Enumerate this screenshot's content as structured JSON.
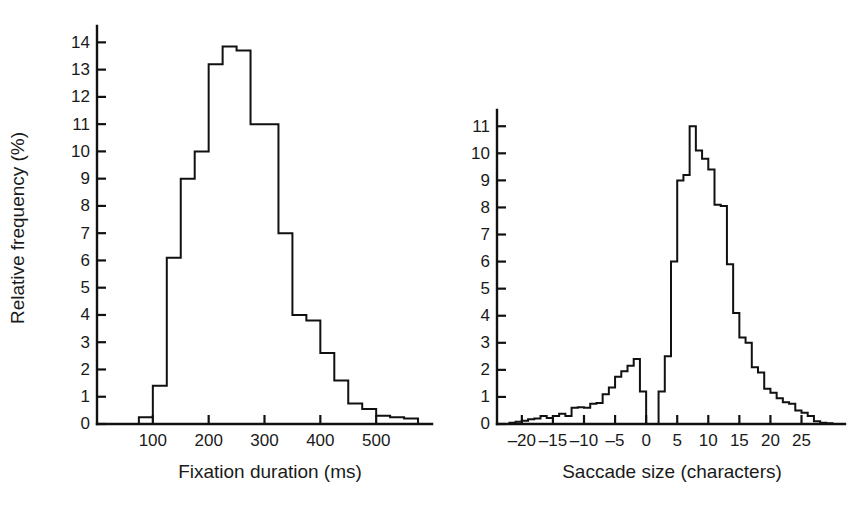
{
  "figure": {
    "shared_ylabel": "Relative frequency (%)",
    "background": "#ffffff",
    "line_color": "#111111"
  },
  "chart_data": [
    {
      "type": "bar",
      "id": "fixation-duration-histogram",
      "title": "",
      "xlabel": "Fixation duration (ms)",
      "ylabel": "Relative frequency (%)",
      "xlim": [
        0,
        600
      ],
      "ylim": [
        0,
        14.6
      ],
      "xticks": [
        100,
        200,
        300,
        400,
        500
      ],
      "xtick_labels": [
        "100",
        "200",
        "300",
        "400",
        "500"
      ],
      "yticks": [
        0,
        1,
        2,
        3,
        4,
        5,
        6,
        7,
        8,
        9,
        10,
        11,
        12,
        13,
        14
      ],
      "ytick_labels": [
        "0",
        "1",
        "2",
        "3",
        "4",
        "5",
        "6",
        "7",
        "8",
        "9",
        "10",
        "11",
        "12",
        "13",
        "14"
      ],
      "grid": false,
      "legend": "none",
      "bin_width": 25,
      "bin_edges": [
        0,
        25,
        50,
        75,
        100,
        125,
        150,
        175,
        200,
        225,
        250,
        275,
        300,
        325,
        350,
        375,
        400,
        425,
        450,
        475,
        500,
        525,
        550,
        575,
        600
      ],
      "categories": [
        "0-25",
        "25-50",
        "50-75",
        "75-100",
        "100-125",
        "125-150",
        "150-175",
        "175-200",
        "200-225",
        "225-250",
        "250-275",
        "275-300",
        "300-325",
        "325-350",
        "350-375",
        "375-400",
        "400-425",
        "425-450",
        "450-475",
        "475-500",
        "500-525",
        "525-550",
        "550-575",
        "575-600"
      ],
      "values": [
        0,
        0,
        0,
        0.25,
        1.4,
        6.1,
        9.0,
        10.0,
        13.2,
        13.85,
        13.7,
        11.0,
        11.0,
        7.0,
        4.0,
        3.8,
        2.6,
        1.6,
        0.75,
        0.55,
        0.3,
        0.25,
        0.2,
        0
      ]
    },
    {
      "type": "bar",
      "id": "saccade-size-histogram",
      "title": "",
      "xlabel": "Saccade size (characters)",
      "ylabel": "Relative frequency (%)",
      "xlim": [
        -24,
        32
      ],
      "ylim": [
        0,
        11.6
      ],
      "xticks": [
        -20,
        -15,
        -10,
        -5,
        0,
        5,
        10,
        15,
        20,
        25
      ],
      "xtick_labels": [
        "–20",
        "–15",
        "–10",
        "–5",
        "0",
        "5",
        "10",
        "15",
        "20",
        "25"
      ],
      "yticks": [
        0,
        1,
        2,
        3,
        4,
        5,
        6,
        7,
        8,
        9,
        10,
        11
      ],
      "ytick_labels": [
        "0",
        "1",
        "2",
        "3",
        "4",
        "5",
        "6",
        "7",
        "8",
        "9",
        "10",
        "11"
      ],
      "grid": false,
      "legend": "none",
      "bin_width": 1,
      "bin_edges": [
        -24,
        -23,
        -22,
        -21,
        -20,
        -19,
        -18,
        -17,
        -16,
        -15,
        -14,
        -13,
        -12,
        -11,
        -10,
        -9,
        -8,
        -7,
        -6,
        -5,
        -4,
        -3,
        -2,
        -1,
        0,
        1,
        2,
        3,
        4,
        5,
        6,
        7,
        8,
        9,
        10,
        11,
        12,
        13,
        14,
        15,
        16,
        17,
        18,
        19,
        20,
        21,
        22,
        23,
        24,
        25,
        26,
        27,
        28,
        29,
        30,
        31,
        32
      ],
      "categories": [
        "-24",
        "-23",
        "-22",
        "-21",
        "-20",
        "-19",
        "-18",
        "-17",
        "-16",
        "-15",
        "-14",
        "-13",
        "-12",
        "-11",
        "-10",
        "-9",
        "-8",
        "-7",
        "-6",
        "-5",
        "-4",
        "-3",
        "-2",
        "-1",
        "0",
        "1",
        "2",
        "3",
        "4",
        "5",
        "6",
        "7",
        "8",
        "9",
        "10",
        "11",
        "12",
        "13",
        "14",
        "15",
        "16",
        "17",
        "18",
        "19",
        "20",
        "21",
        "22",
        "23",
        "24",
        "25",
        "26",
        "27",
        "28",
        "29",
        "30",
        "31"
      ],
      "values": [
        0,
        0,
        0.05,
        0.08,
        0.12,
        0.18,
        0.2,
        0.3,
        0.22,
        0.3,
        0.38,
        0.3,
        0.6,
        0.62,
        0.6,
        0.75,
        0.78,
        1.1,
        1.35,
        1.75,
        1.95,
        2.15,
        2.4,
        1.2,
        0.0,
        0.0,
        1.2,
        2.5,
        6.0,
        9.0,
        9.2,
        11.0,
        10.1,
        9.8,
        9.4,
        8.1,
        8.05,
        5.9,
        4.1,
        3.2,
        3.0,
        2.1,
        1.9,
        1.3,
        1.15,
        0.95,
        0.8,
        0.75,
        0.5,
        0.42,
        0.3,
        0.1,
        0.05,
        0.03,
        0.0,
        0.0
      ]
    }
  ]
}
